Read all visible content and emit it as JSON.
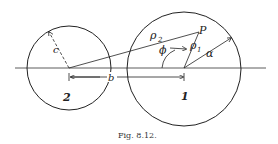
{
  "figure": {
    "caption": "Fig. 8.12.",
    "labels": {
      "point": "P",
      "rho1": "ρ",
      "rho1_sub": "1",
      "rho2": "ρ",
      "rho2_sub": "2",
      "phi": "ϕ",
      "a": "α",
      "b": "b",
      "c": "c",
      "circle1": "1",
      "circle2": "2"
    },
    "colors": {
      "stroke": "#222222",
      "background": "#ffffff"
    }
  }
}
